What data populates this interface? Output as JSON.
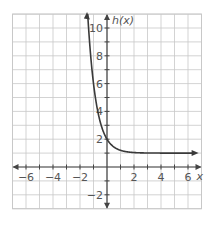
{
  "chart_data": {
    "type": "line",
    "title": "",
    "xlabel": "x",
    "ylabel": "h(x)",
    "xlim": [
      -7,
      7
    ],
    "ylim": [
      -3,
      11
    ],
    "grid": true,
    "x_ticks": [
      -6,
      -4,
      -2,
      2,
      4,
      6
    ],
    "y_ticks": [
      -2,
      2,
      4,
      6,
      8,
      10
    ],
    "x_tick_labels": [
      "−6",
      "−4",
      "−2",
      "2",
      "4",
      "6"
    ],
    "y_tick_labels": [
      "−2",
      "2",
      "4",
      "6",
      "8",
      "10"
    ],
    "series": [
      {
        "name": "h(x)",
        "description": "decreasing exponential with horizontal asymptote y = 1, y-intercept (0, 2)",
        "x": [
          -1.43,
          -1.25,
          -1.0,
          -0.75,
          -0.5,
          -0.25,
          0,
          0.25,
          0.5,
          1.0,
          1.5,
          2.0,
          3.0,
          4.0,
          5.0,
          6.0
        ],
        "values": [
          11.0,
          8.48,
          6.0,
          4.34,
          3.24,
          2.5,
          2.0,
          1.67,
          1.45,
          1.2,
          1.09,
          1.04,
          1.01,
          1.0,
          1.0,
          1.0
        ]
      }
    ],
    "asymptote_y": 1,
    "y_intercept": 2
  },
  "labels": {
    "x_axis": "x",
    "y_axis": "h(x)"
  },
  "colors": {
    "grid": "#c8c8c8",
    "axis": "#444444",
    "curve": "#3a3a3a",
    "text": "#555555"
  }
}
